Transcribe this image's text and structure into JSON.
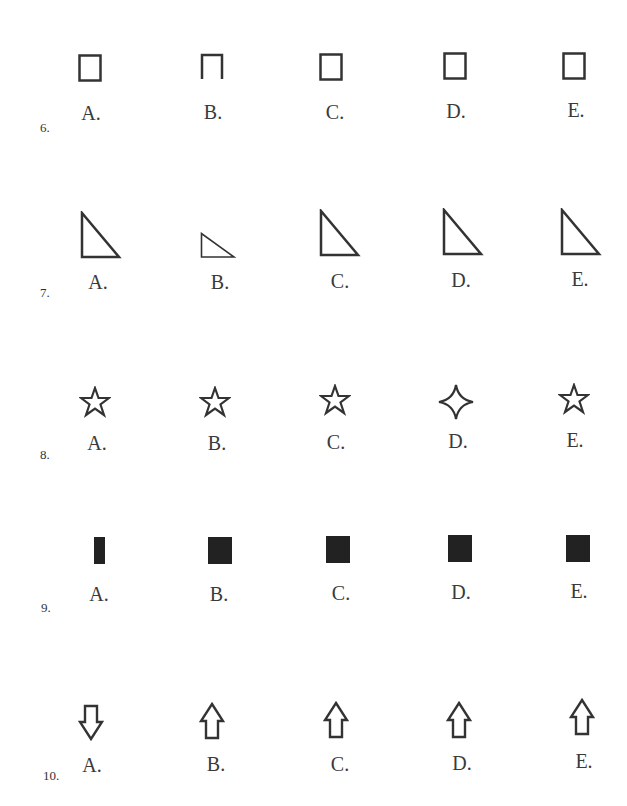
{
  "questions": [
    {
      "number": "6.",
      "shape_type": "square-outline",
      "options": [
        {
          "label": "A.",
          "shape": "square-outline"
        },
        {
          "label": "B.",
          "shape": "square-open-bottom"
        },
        {
          "label": "C.",
          "shape": "square-outline"
        },
        {
          "label": "D.",
          "shape": "square-outline"
        },
        {
          "label": "E.",
          "shape": "square-outline"
        }
      ]
    },
    {
      "number": "7.",
      "shape_type": "right-triangle-outline",
      "options": [
        {
          "label": "A.",
          "shape": "right-triangle-large"
        },
        {
          "label": "B.",
          "shape": "right-triangle-small"
        },
        {
          "label": "C.",
          "shape": "right-triangle-large"
        },
        {
          "label": "D.",
          "shape": "right-triangle-large"
        },
        {
          "label": "E.",
          "shape": "right-triangle-large"
        }
      ]
    },
    {
      "number": "8.",
      "shape_type": "star-outline",
      "options": [
        {
          "label": "A.",
          "shape": "five-point-star"
        },
        {
          "label": "B.",
          "shape": "five-point-star"
        },
        {
          "label": "C.",
          "shape": "five-point-star"
        },
        {
          "label": "D.",
          "shape": "four-point-star"
        },
        {
          "label": "E.",
          "shape": "five-point-star"
        }
      ]
    },
    {
      "number": "9.",
      "shape_type": "filled-square",
      "options": [
        {
          "label": "A.",
          "shape": "filled-narrow-rectangle"
        },
        {
          "label": "B.",
          "shape": "filled-square"
        },
        {
          "label": "C.",
          "shape": "filled-square"
        },
        {
          "label": "D.",
          "shape": "filled-square"
        },
        {
          "label": "E.",
          "shape": "filled-square"
        }
      ]
    },
    {
      "number": "10.",
      "shape_type": "arrow-outline",
      "options": [
        {
          "label": "A.",
          "shape": "arrow-down"
        },
        {
          "label": "B.",
          "shape": "arrow-up"
        },
        {
          "label": "C.",
          "shape": "arrow-up"
        },
        {
          "label": "D.",
          "shape": "arrow-up"
        },
        {
          "label": "E.",
          "shape": "arrow-up"
        }
      ]
    }
  ],
  "colors": {
    "ink": "#333333",
    "fill": "#222222",
    "background": "#ffffff"
  }
}
